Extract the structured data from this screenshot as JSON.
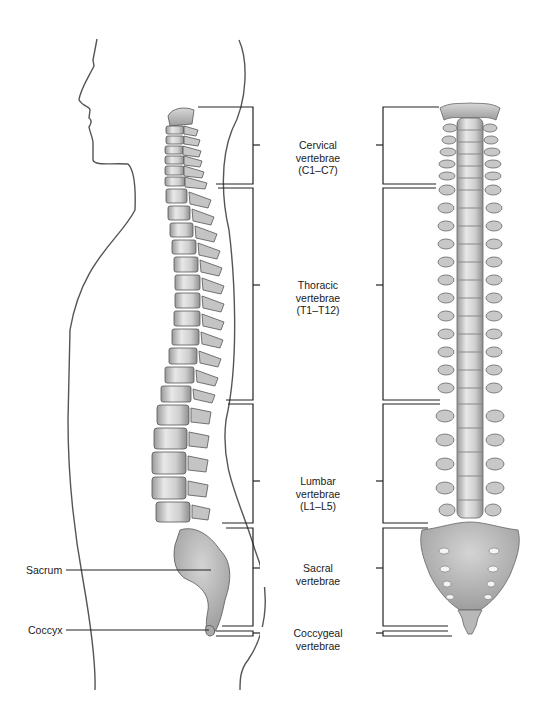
{
  "diagram": {
    "type": "anatomical",
    "colors": {
      "outline": "#555555",
      "bracket": "#222222",
      "bone_light": "#e4e4e4",
      "bone_mid": "#bdbdbd",
      "bone_dark": "#8a8a8a",
      "text": "#1a1a1a"
    },
    "regions": [
      {
        "id": "cervical",
        "line1": "Cervical",
        "line2": "vertebrae",
        "line3": "(C1–C7)"
      },
      {
        "id": "thoracic",
        "line1": "Thoracic",
        "line2": "vertebrae",
        "line3": "(T1–T12)"
      },
      {
        "id": "lumbar",
        "line1": "Lumbar",
        "line2": "vertebrae",
        "line3": "(L1–L5)"
      },
      {
        "id": "sacral",
        "line1": "Sacral",
        "line2": "vertebrae",
        "line3": ""
      },
      {
        "id": "coccygeal",
        "line1": "Coccygeal",
        "line2": "vertebrae",
        "line3": ""
      }
    ],
    "side_labels": [
      {
        "id": "sacrum",
        "text": "Sacrum"
      },
      {
        "id": "coccyx",
        "text": "Coccyx"
      }
    ],
    "views": [
      {
        "id": "lateral",
        "label": "Lateral view with body outline"
      },
      {
        "id": "posterior",
        "label": "Posterior view"
      }
    ]
  }
}
